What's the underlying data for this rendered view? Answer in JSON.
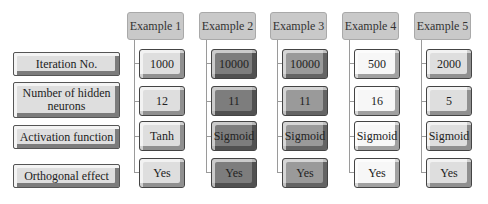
{
  "row_labels": {
    "iteration": "Iteration No.",
    "hidden_neurons": "Number of hidden neurons",
    "activation": "Activation function",
    "orthogonal": "Orthogonal effect"
  },
  "examples": [
    {
      "title": "Example 1",
      "iteration": "1000",
      "hidden_neurons": "12",
      "activation": "Tanh",
      "orthogonal": "Yes"
    },
    {
      "title": "Example 2",
      "iteration": "10000",
      "hidden_neurons": "11",
      "activation": "Sigmoid",
      "orthogonal": "Yes"
    },
    {
      "title": "Example 3",
      "iteration": "10000",
      "hidden_neurons": "11",
      "activation": "Sigmoid",
      "orthogonal": "Yes"
    },
    {
      "title": "Example 4",
      "iteration": "500",
      "hidden_neurons": "16",
      "activation": "Sigmoid",
      "orthogonal": "Yes"
    },
    {
      "title": "Example 5",
      "iteration": "2000",
      "hidden_neurons": "5",
      "activation": "Sigmoid",
      "orthogonal": "Yes"
    }
  ],
  "colors": {
    "header": "#c9c9c9",
    "light": "#dedede",
    "white": "#f7f7f7",
    "mid": "#9a9a9a",
    "dark": "#7d7d7d"
  }
}
